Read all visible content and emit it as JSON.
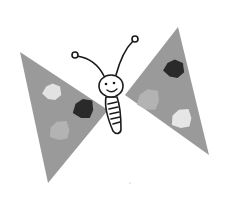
{
  "image": {
    "subject": "butterfly drawing",
    "style": "grayscale collage illustration",
    "background_color": "#ffffff"
  },
  "butterfly": {
    "wing_color": "#9a9a9a",
    "outline_color": "#1a1a1a",
    "body_fill": "#ffffff",
    "left_wing": {
      "points": "20,52 108,110 48,183",
      "spots": [
        {
          "name": "light-spot",
          "color": "#e2e2e2",
          "cx": 52,
          "cy": 92,
          "r": 10
        },
        {
          "name": "dark-spot",
          "color": "#2a2a2a",
          "cx": 84,
          "cy": 109,
          "r": 12
        },
        {
          "name": "mid-spot",
          "color": "#b3b3b3",
          "cx": 60,
          "cy": 131,
          "r": 12
        }
      ]
    },
    "right_wing": {
      "points": "178,27 209,155 125,95",
      "spots": [
        {
          "name": "dark-spot",
          "color": "#2a2a2a",
          "cx": 174,
          "cy": 69,
          "r": 11
        },
        {
          "name": "mid-spot",
          "color": "#b3b3b3",
          "cx": 149,
          "cy": 100,
          "r": 13
        },
        {
          "name": "light-spot",
          "color": "#e6e6e6",
          "cx": 182,
          "cy": 119,
          "r": 12
        }
      ]
    },
    "head": {
      "cx": 111,
      "cy": 86,
      "r": 12
    },
    "antennae": {
      "left_tip": {
        "cx": 75,
        "cy": 55,
        "r": 3
      },
      "right_tip": {
        "cx": 135,
        "cy": 39,
        "r": 3
      }
    }
  }
}
